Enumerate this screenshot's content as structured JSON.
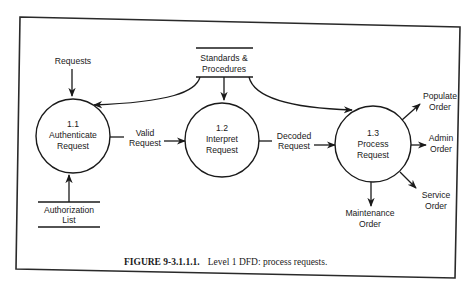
{
  "diagram": {
    "type": "Level 1 Data Flow Diagram",
    "processes": [
      {
        "id": "1.1",
        "name_line1": "Authenticate",
        "name_line2": "Request"
      },
      {
        "id": "1.2",
        "name_line1": "Interpret",
        "name_line2": "Request"
      },
      {
        "id": "1.3",
        "name_line1": "Process",
        "name_line2": "Request"
      }
    ],
    "data_stores": {
      "standards": {
        "line1": "Standards &",
        "line2": "Procedures"
      },
      "authorization": {
        "line1": "Authorization",
        "line2": "List"
      }
    },
    "flows": {
      "requests": "Requests",
      "valid_request": {
        "line1": "Valid",
        "line2": "Request"
      },
      "decoded_request": {
        "line1": "Decoded",
        "line2": "Request"
      },
      "populate_order": {
        "line1": "Populate",
        "line2": "Order"
      },
      "admin_order": {
        "line1": "Admin",
        "line2": "Order"
      },
      "service_order": {
        "line1": "Service",
        "line2": "Order"
      },
      "maintenance_order": {
        "line1": "Maintenance",
        "line2": "Order"
      }
    },
    "caption": {
      "label": "FIGURE 9-3.1.1.1.",
      "text": "Level 1 DFD: process requests."
    }
  }
}
